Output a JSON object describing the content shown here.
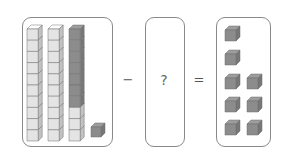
{
  "equation": {
    "minus_sign": "−",
    "equals_sign": "=",
    "unknown": "?"
  },
  "left_box": {
    "rods": [
      {
        "cubes": 10,
        "dark_cubes": 0
      },
      {
        "cubes": 10,
        "dark_cubes": 0
      },
      {
        "cubes": 10,
        "dark_cubes": 7
      }
    ],
    "single_cubes": 1,
    "total_value": 31
  },
  "right_box": {
    "single_cubes": 8,
    "layout_rows": [
      1,
      1,
      2,
      2,
      2
    ]
  },
  "colors": {
    "light_cube": "#e4e4e4",
    "dark_cube": "#8c8c8c",
    "border": "#8a8a8a"
  }
}
